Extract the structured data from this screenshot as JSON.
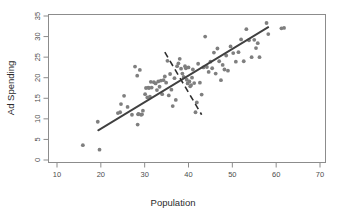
{
  "chart_data": {
    "type": "scatter",
    "title": "",
    "xlabel": "Population",
    "ylabel": "Ad Spending",
    "xlim": [
      6,
      73
    ],
    "ylim": [
      -1,
      36
    ],
    "xticks": [
      10,
      20,
      30,
      40,
      50,
      60,
      70
    ],
    "yticks": [
      0,
      5,
      10,
      15,
      20,
      25,
      30,
      35
    ],
    "grid": false,
    "legend": "none",
    "point_color": "#7f7f7f",
    "line_color": "#404040",
    "dashed_color": "#2e2e2e",
    "frame_color": "#8c8c8c",
    "series": [
      {
        "name": "observations",
        "x": [
          15.9,
          19.7,
          19.3,
          23.9,
          24.6,
          24.4,
          25.3,
          26.1,
          27.1,
          27.8,
          28.3,
          28.4,
          28.5,
          28.6,
          28.9,
          29.2,
          29.4,
          29.6,
          30.1,
          30.3,
          30.6,
          30.8,
          31.0,
          31.2,
          31.4,
          31.6,
          32.1,
          32.5,
          32.8,
          33.1,
          33.4,
          33.7,
          34.0,
          34.3,
          34.6,
          34.9,
          35.2,
          35.5,
          35.8,
          36.1,
          36.4,
          36.8,
          37.1,
          37.4,
          37.7,
          38.0,
          38.3,
          38.6,
          38.9,
          39.2,
          39.4,
          39.6,
          39.8,
          40.0,
          40.2,
          40.4,
          40.6,
          40.8,
          41.0,
          41.3,
          41.6,
          41.9,
          42.2,
          42.6,
          43.0,
          43.4,
          43.8,
          44.2,
          44.6,
          45.0,
          45.4,
          45.8,
          46.2,
          46.6,
          47.0,
          47.4,
          47.8,
          48.2,
          48.6,
          49.0,
          49.6,
          50.2,
          50.8,
          51.4,
          52.0,
          52.6,
          53.2,
          53.8,
          54.4,
          55.0,
          55.4,
          55.8,
          56.2,
          57.8,
          58.2,
          61.2,
          61.8
        ],
        "y": [
          3.6,
          2.5,
          9.3,
          11.4,
          13.6,
          11.6,
          15.6,
          12.9,
          11.0,
          22.7,
          20.5,
          8.6,
          11.1,
          11.2,
          21.9,
          11.0,
          11.1,
          12.0,
          16.0,
          17.5,
          15.2,
          17.6,
          17.5,
          15.4,
          19.0,
          17.6,
          18.9,
          18.6,
          17.0,
          19.1,
          17.8,
          19.3,
          16.0,
          19.4,
          20.3,
          18.8,
          24.1,
          15.7,
          20.9,
          17.1,
          13.1,
          19.9,
          14.6,
          22.8,
          23.5,
          24.6,
          22.2,
          21.0,
          20.2,
          22.8,
          22.3,
          19.5,
          18.6,
          22.5,
          19.1,
          17.9,
          18.2,
          20.0,
          22.0,
          18.7,
          11.6,
          14.0,
          23.4,
          18.8,
          15.9,
          22.5,
          30.0,
          22.6,
          21.4,
          23.9,
          22.3,
          26.1,
          21.0,
          27.1,
          24.0,
          19.4,
          23.1,
          22.0,
          25.4,
          21.7,
          27.6,
          26.0,
          23.9,
          26.2,
          29.3,
          24.0,
          31.8,
          29.1,
          25.0,
          29.2,
          27.2,
          28.4,
          25.0,
          33.3,
          30.6,
          32.0,
          32.1
        ]
      }
    ],
    "fit_line": {
      "name": "regression-line",
      "x_start": 19.4,
      "y_start": 7.2,
      "x_end": 58.2,
      "y_end": 32.3
    },
    "perpendicular_segment": {
      "name": "residual-direction-dashed",
      "x_start": 34.6,
      "y_start": 26.2,
      "x_end": 43.0,
      "y_end": 11.0
    }
  }
}
